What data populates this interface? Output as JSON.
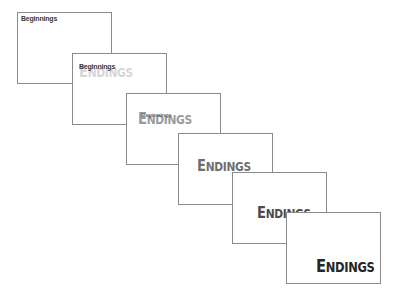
{
  "diagram": {
    "start_text": "Beginnings",
    "end_text": "ENDINGS",
    "end_text_cap": "E",
    "end_text_rest": "NDINGS",
    "frames": [
      {
        "index": 1,
        "begin_label": "Beginnings",
        "end_label": "",
        "end_color": "#ffffff",
        "begin_color": "#3a3a3a"
      },
      {
        "index": 2,
        "begin_label": "Beginnings",
        "end_label": "ENDINGS",
        "end_color": "#d6d6d6",
        "begin_color": "#3a3a3a"
      },
      {
        "index": 3,
        "begin_label": "Beginnings",
        "end_label": "ENDINGS",
        "end_color": "#9a9a9a",
        "begin_color": "#5a5a5a"
      },
      {
        "index": 4,
        "begin_label": "",
        "end_label": "ENDINGS",
        "end_color": "#6e6e6e",
        "begin_color": "#ffffff"
      },
      {
        "index": 5,
        "begin_label": "",
        "end_label": "ENDINGS",
        "end_color": "#4c4c4c",
        "begin_color": "#ffffff"
      },
      {
        "index": 6,
        "begin_label": "",
        "end_label": "ENDINGS",
        "end_color": "#262626",
        "begin_color": "#ffffff"
      }
    ]
  }
}
